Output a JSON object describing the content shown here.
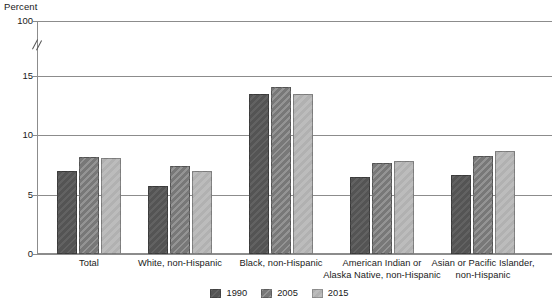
{
  "chart_data": {
    "type": "bar",
    "title": "",
    "subtitle": "",
    "xlabel": "",
    "ylabel": "Percent",
    "ylim": [
      0,
      100
    ],
    "grid": true,
    "legend_position": "bottom",
    "axis_break": {
      "present": true,
      "between": [
        15,
        100
      ],
      "note": "double-slash break mark on y-axis between 15 and 100"
    },
    "y_ticks": [
      {
        "label": "0",
        "value": 0
      },
      {
        "label": "5",
        "value": 5
      },
      {
        "label": "10",
        "value": 10
      },
      {
        "label": "15",
        "value": 15
      },
      {
        "label": "100",
        "value": 100
      }
    ],
    "categories": [
      "Total",
      "White, non-Hispanic",
      "Black, non-Hispanic",
      "American Indian or\nAlaska Native, non-Hispanic",
      "Asian or Pacific Islander,\nnon-Hispanic"
    ],
    "series": [
      {
        "name": "1990",
        "color": "#595959",
        "values": [
          7.0,
          5.7,
          13.5,
          6.5,
          6.7
        ]
      },
      {
        "name": "2005",
        "color": "#7f7f7f",
        "values": [
          8.2,
          7.4,
          14.1,
          7.7,
          8.3
        ]
      },
      {
        "name": "2015",
        "color": "#b4b4b4",
        "values": [
          8.1,
          7.0,
          13.5,
          7.8,
          8.7
        ]
      }
    ]
  },
  "legend": {
    "items": [
      {
        "label": "1990"
      },
      {
        "label": "2005"
      },
      {
        "label": "2015"
      }
    ]
  }
}
